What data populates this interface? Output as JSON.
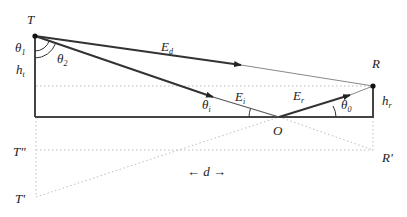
{
  "diagram": {
    "points": {
      "T": {
        "label": "T"
      },
      "R": {
        "label": "R"
      },
      "O": {
        "label": "O"
      },
      "T_double_prime": {
        "label": "T\"",
        "base": "T",
        "mark": "\""
      },
      "R_prime": {
        "label": "R'",
        "base": "R",
        "mark": "'"
      },
      "T_prime": {
        "label": "T'",
        "base": "T",
        "mark": "'"
      }
    },
    "rays": {
      "direct": {
        "base": "E",
        "sub": "d"
      },
      "incident": {
        "base": "E",
        "sub": "i"
      },
      "reflected": {
        "base": "E",
        "sub": "r"
      }
    },
    "angles": {
      "theta1": {
        "base": "θ",
        "sub": "1"
      },
      "theta2": {
        "base": "θ",
        "sub": "2"
      },
      "theta_i": {
        "base": "θ",
        "sub": "i"
      },
      "theta0": {
        "base": "θ",
        "sub": "0"
      }
    },
    "heights": {
      "h_t": {
        "base": "h",
        "sub": "t"
      },
      "h_r": {
        "base": "h",
        "sub": "r"
      }
    },
    "distance": {
      "left_arrow": "←",
      "label": "d",
      "right_arrow": "→"
    },
    "colors": {
      "line": "#333333",
      "thin_line": "#888888",
      "dotted": "#bbbbbb"
    }
  }
}
